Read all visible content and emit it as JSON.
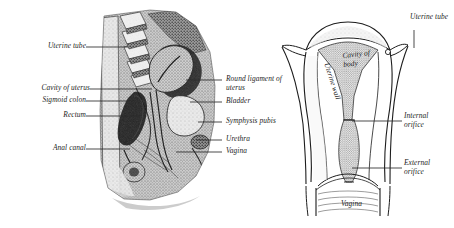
{
  "figure": {
    "type": "anatomical-illustration",
    "background": "#ffffff",
    "ink": "#1d1d1d",
    "panels": [
      {
        "id": "left",
        "name": "sagittal-section-female-pelvis",
        "style": "halftone-engraving",
        "orientation": "median sagittal section"
      },
      {
        "id": "right",
        "name": "coronal-section-uterus",
        "style": "line-drawing",
        "orientation": "coronal section"
      }
    ]
  },
  "left_panel": {
    "labels_left": [
      {
        "text": "Uterine tube",
        "x": 30,
        "y": 44
      },
      {
        "text": "Cavity of uterus",
        "x": 16,
        "y": 86
      },
      {
        "text": "Sigmoid colon",
        "x": 22,
        "y": 98
      },
      {
        "text": "Rectum",
        "x": 48,
        "y": 113
      },
      {
        "text": "Anal canal",
        "x": 35,
        "y": 146
      }
    ],
    "labels_right": [
      {
        "text": "Round ligament of uterus",
        "x": 226,
        "y": 77,
        "wrap": true
      },
      {
        "text": "Bladder",
        "x": 226,
        "y": 99
      },
      {
        "text": "Symphysis pubis",
        "x": 226,
        "y": 119
      },
      {
        "text": "Urethra",
        "x": 226,
        "y": 137
      },
      {
        "text": "Vagina",
        "x": 226,
        "y": 149
      }
    ]
  },
  "right_panel": {
    "labels_outer": [
      {
        "text": "Uterine tube",
        "x": 412,
        "y": 15
      },
      {
        "text": "Internal orifice",
        "x": 404,
        "y": 114
      },
      {
        "text": "External orifice",
        "x": 404,
        "y": 161
      }
    ],
    "labels_inner": [
      {
        "text": "Cavity of body",
        "x": 345,
        "y": 55
      },
      {
        "text": "Uterine wall",
        "x": 330,
        "y": 64
      },
      {
        "text": "Vagina",
        "x": 343,
        "y": 202
      }
    ]
  }
}
